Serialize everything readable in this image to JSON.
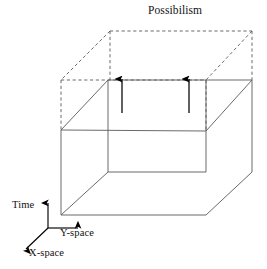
{
  "figure": {
    "title": "Possibilism",
    "type": "3d-spacetime-cube-diagram",
    "background_color": "#ffffff",
    "line_color": "#4a4a4a",
    "dashed_line_color": "#5a5a5a",
    "arrow_color": "#000000",
    "axis_color": "#000000",
    "axes": {
      "vertical": "Time",
      "horizontal_right": "Y-space",
      "diagonal_left": "X-space"
    },
    "arrows": {
      "count": 2,
      "direction": "up",
      "meaning": "possibility-expansion"
    },
    "regions": {
      "solid_prism": "realized space-time volume",
      "dashed_prism": "possible space-time volume"
    }
  },
  "geometry": {
    "solid": {
      "front_top_left": [
        108,
        80
      ],
      "front_top_right": [
        206,
        80
      ],
      "front_bottom_left": [
        108,
        172
      ],
      "front_bottom_right": [
        206,
        172
      ],
      "back_top_left": [
        61,
        130
      ],
      "back_top_right": [
        252,
        80
      ],
      "back_bottom_left": [
        61,
        215
      ],
      "back_bottom_right": [
        252,
        172
      ]
    },
    "dashed": {
      "top_back_left": [
        110,
        31
      ],
      "top_back_right": [
        252,
        31
      ],
      "top_front_left": [
        61,
        80
      ],
      "top_front_right": [
        206,
        80
      ]
    },
    "arrow_x_positions": [
      122,
      189
    ],
    "arrow_tip_y": 77,
    "arrow_tail_y": 113,
    "axis_origin": [
      48,
      228
    ]
  }
}
